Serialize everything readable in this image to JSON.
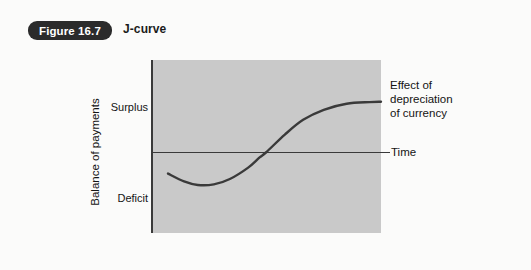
{
  "header": {
    "badge_label": "Figure 16.7",
    "title": "J-curve"
  },
  "chart_data": {
    "type": "line",
    "title": "J-curve",
    "xlabel": "Time",
    "ylabel": "Balance of payments",
    "ytick_labels": [
      "Surplus",
      "Deficit"
    ],
    "grid": false,
    "legend_position": "inline-right",
    "annotations": [
      {
        "name": "series-label",
        "lines": [
          "Effect of",
          "depreciation",
          "of currency"
        ],
        "target": "curve-end"
      },
      {
        "name": "x-axis-label",
        "lines": [
          "Time"
        ],
        "target": "zero-line-end"
      }
    ],
    "axis_lines": {
      "vertical_axis": true,
      "zero_horizontal_line": true
    },
    "plot_background_color": "#c9c9c9",
    "curve_color": "#3a3a3a",
    "badge_color": "#2b2b2b",
    "series": [
      {
        "name": "Effect of depreciation of currency",
        "description": "Balance of payments first worsens into deficit, then improves into surplus and levels off",
        "points": [
          {
            "x": 0.07,
            "y": -0.36
          },
          {
            "x": 0.14,
            "y": -0.49
          },
          {
            "x": 0.2,
            "y": -0.55
          },
          {
            "x": 0.27,
            "y": -0.54
          },
          {
            "x": 0.34,
            "y": -0.45
          },
          {
            "x": 0.42,
            "y": -0.26
          },
          {
            "x": 0.47,
            "y": -0.09
          },
          {
            "x": 0.5,
            "y": 0.0
          },
          {
            "x": 0.58,
            "y": 0.26
          },
          {
            "x": 0.66,
            "y": 0.48
          },
          {
            "x": 0.75,
            "y": 0.63
          },
          {
            "x": 0.85,
            "y": 0.72
          },
          {
            "x": 0.95,
            "y": 0.745
          },
          {
            "x": 1.0,
            "y": 0.75
          }
        ]
      }
    ],
    "xlim": [
      0,
      1
    ],
    "ylim": [
      -1,
      1
    ]
  }
}
